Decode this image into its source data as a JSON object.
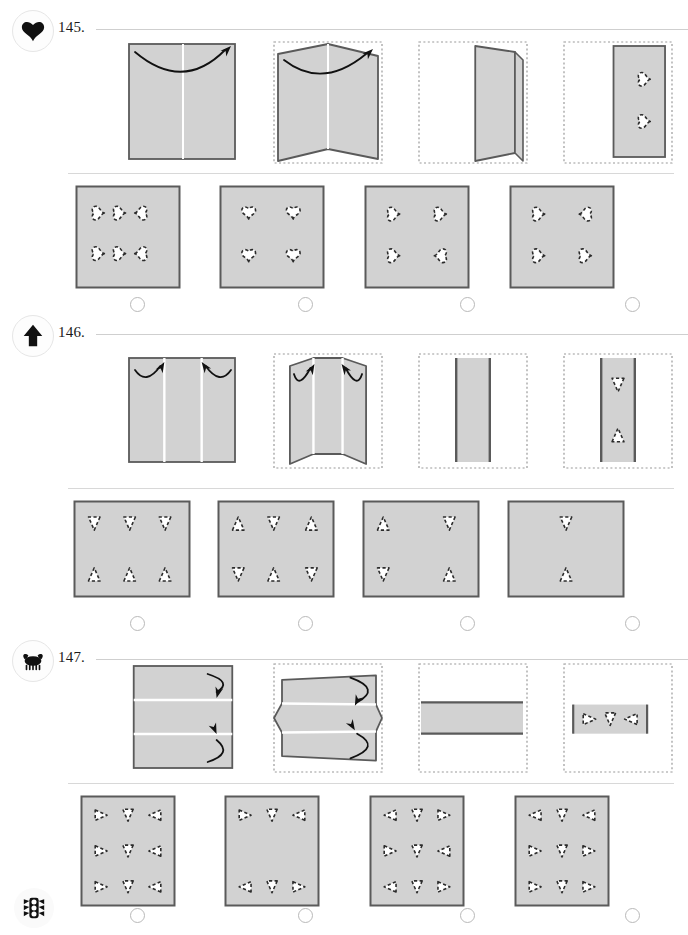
{
  "page": {
    "width": 688,
    "height": 935,
    "paper_fill": "#d2d2d2",
    "paper_stroke": "#5a5a5a",
    "ghost_stroke": "#9a9a9a",
    "cut_stroke": "#2b2b2b",
    "cut_fill": "#ffffff",
    "rule_color": "#cfcfcf",
    "arrow_color": "#111111"
  },
  "footer": {
    "icon": "traffic-light-icon"
  },
  "questions": [
    {
      "number": "145.",
      "icon": "heart-icon",
      "top": 10,
      "prompt_top": 40,
      "options_top": 185,
      "radios_top": 297,
      "shape": "heart",
      "prompt": [
        {
          "name": "fold-step-1",
          "type": "flat-square",
          "creases": [
            "v-center"
          ],
          "arrow": "curve-up-right"
        },
        {
          "name": "fold-step-2",
          "type": "bent-book",
          "ghost": true
        },
        {
          "name": "fold-step-3",
          "type": "folded-half",
          "ghost": true
        },
        {
          "name": "fold-step-4",
          "type": "punched-half",
          "ghost": true,
          "cuts": [
            {
              "x": 0.55,
              "y": 0.3,
              "rot": -90
            },
            {
              "x": 0.55,
              "y": 0.68,
              "rot": -90
            }
          ]
        }
      ],
      "options": [
        {
          "label": "option-a",
          "cuts": [
            {
              "x": 0.22,
              "y": 0.27,
              "rot": -90
            },
            {
              "x": 0.42,
              "y": 0.27,
              "rot": -90
            },
            {
              "x": 0.62,
              "y": 0.27,
              "rot": 90
            },
            {
              "x": 0.22,
              "y": 0.66,
              "rot": -90
            },
            {
              "x": 0.42,
              "y": 0.66,
              "rot": -90
            },
            {
              "x": 0.62,
              "y": 0.66,
              "rot": 90
            }
          ]
        },
        {
          "label": "option-b",
          "cuts": [
            {
              "x": 0.28,
              "y": 0.27,
              "rot": 0
            },
            {
              "x": 0.7,
              "y": 0.27,
              "rot": 0
            },
            {
              "x": 0.28,
              "y": 0.68,
              "rot": 0
            },
            {
              "x": 0.7,
              "y": 0.68,
              "rot": 0
            }
          ]
        },
        {
          "label": "option-c",
          "cuts": [
            {
              "x": 0.28,
              "y": 0.28,
              "rot": -90
            },
            {
              "x": 0.72,
              "y": 0.28,
              "rot": -90
            },
            {
              "x": 0.28,
              "y": 0.68,
              "rot": -90
            },
            {
              "x": 0.72,
              "y": 0.68,
              "rot": 90
            }
          ]
        },
        {
          "label": "option-d",
          "cuts": [
            {
              "x": 0.28,
              "y": 0.28,
              "rot": -90
            },
            {
              "x": 0.72,
              "y": 0.28,
              "rot": 90
            },
            {
              "x": 0.28,
              "y": 0.68,
              "rot": -90
            },
            {
              "x": 0.72,
              "y": 0.68,
              "rot": -90
            }
          ]
        }
      ]
    },
    {
      "number": "146.",
      "icon": "arrow-up-icon",
      "top": 315,
      "prompt_top": 352,
      "options_top": 500,
      "radios_top": 616,
      "shape": "triangle",
      "prompt": [
        {
          "name": "fold-step-1",
          "type": "flat-wide",
          "creases": [
            "v-third",
            "v-twothird"
          ],
          "arrow": "two-inward"
        },
        {
          "name": "fold-step-2",
          "type": "bent-trifold",
          "ghost": true
        },
        {
          "name": "fold-step-3",
          "type": "folded-third",
          "ghost": true
        },
        {
          "name": "fold-step-4",
          "type": "punched-third",
          "ghost": true,
          "cuts": [
            {
              "x": 0.5,
              "y": 0.26,
              "rot": 90
            },
            {
              "x": 0.5,
              "y": 0.74,
              "rot": -90
            }
          ]
        }
      ],
      "options": [
        {
          "label": "option-a",
          "cuts": [
            {
              "x": 0.18,
              "y": 0.24,
              "rot": 90
            },
            {
              "x": 0.48,
              "y": 0.24,
              "rot": 90
            },
            {
              "x": 0.78,
              "y": 0.24,
              "rot": 90
            },
            {
              "x": 0.18,
              "y": 0.76,
              "rot": -90
            },
            {
              "x": 0.48,
              "y": 0.76,
              "rot": -90
            },
            {
              "x": 0.78,
              "y": 0.76,
              "rot": -90
            }
          ]
        },
        {
          "label": "option-b",
          "cuts": [
            {
              "x": 0.18,
              "y": 0.24,
              "rot": -90
            },
            {
              "x": 0.48,
              "y": 0.24,
              "rot": 90
            },
            {
              "x": 0.8,
              "y": 0.24,
              "rot": -90
            },
            {
              "x": 0.18,
              "y": 0.76,
              "rot": 90
            },
            {
              "x": 0.48,
              "y": 0.76,
              "rot": -90
            },
            {
              "x": 0.8,
              "y": 0.76,
              "rot": 90
            }
          ]
        },
        {
          "label": "option-c",
          "cuts": [
            {
              "x": 0.18,
              "y": 0.24,
              "rot": -90
            },
            {
              "x": 0.74,
              "y": 0.24,
              "rot": 90
            },
            {
              "x": 0.18,
              "y": 0.76,
              "rot": 90
            },
            {
              "x": 0.74,
              "y": 0.76,
              "rot": -90
            }
          ]
        },
        {
          "label": "option-d",
          "cuts": [
            {
              "x": 0.5,
              "y": 0.24,
              "rot": 90
            },
            {
              "x": 0.5,
              "y": 0.76,
              "rot": -90
            }
          ]
        }
      ]
    },
    {
      "number": "147.",
      "icon": "crab-icon",
      "top": 640,
      "prompt_top": 662,
      "options_top": 795,
      "radios_top": 908,
      "shape": "triangle",
      "prompt": [
        {
          "name": "fold-step-1",
          "type": "flat-tall",
          "creases": [
            "h-third",
            "h-twothird"
          ],
          "arrow": "two-vertical"
        },
        {
          "name": "fold-step-2",
          "type": "bent-trifold-h",
          "ghost": true
        },
        {
          "name": "fold-step-3",
          "type": "folded-band",
          "ghost": true
        },
        {
          "name": "fold-step-4",
          "type": "punched-band",
          "ghost": true,
          "cuts": [
            {
              "x": 0.22,
              "y": 0.5,
              "rot": 0
            },
            {
              "x": 0.5,
              "y": 0.5,
              "rot": 90
            },
            {
              "x": 0.78,
              "y": 0.5,
              "rot": 180
            }
          ]
        }
      ],
      "options": [
        {
          "label": "option-a",
          "cuts": [
            {
              "x": 0.22,
              "y": 0.18,
              "rot": 0
            },
            {
              "x": 0.5,
              "y": 0.18,
              "rot": 90
            },
            {
              "x": 0.78,
              "y": 0.18,
              "rot": 180
            },
            {
              "x": 0.22,
              "y": 0.5,
              "rot": 0
            },
            {
              "x": 0.5,
              "y": 0.5,
              "rot": 90
            },
            {
              "x": 0.78,
              "y": 0.5,
              "rot": 180
            },
            {
              "x": 0.22,
              "y": 0.82,
              "rot": 0
            },
            {
              "x": 0.5,
              "y": 0.82,
              "rot": 90
            },
            {
              "x": 0.78,
              "y": 0.82,
              "rot": 180
            }
          ]
        },
        {
          "label": "option-b",
          "cuts": [
            {
              "x": 0.22,
              "y": 0.18,
              "rot": 0
            },
            {
              "x": 0.5,
              "y": 0.18,
              "rot": 90
            },
            {
              "x": 0.78,
              "y": 0.18,
              "rot": 180
            },
            {
              "x": 0.22,
              "y": 0.82,
              "rot": 180
            },
            {
              "x": 0.5,
              "y": 0.82,
              "rot": 90
            },
            {
              "x": 0.78,
              "y": 0.82,
              "rot": 0
            }
          ]
        },
        {
          "label": "option-c",
          "cuts": [
            {
              "x": 0.22,
              "y": 0.18,
              "rot": 180
            },
            {
              "x": 0.5,
              "y": 0.18,
              "rot": 90
            },
            {
              "x": 0.78,
              "y": 0.18,
              "rot": 0
            },
            {
              "x": 0.22,
              "y": 0.5,
              "rot": 0
            },
            {
              "x": 0.5,
              "y": 0.5,
              "rot": 90
            },
            {
              "x": 0.78,
              "y": 0.5,
              "rot": 180
            },
            {
              "x": 0.22,
              "y": 0.82,
              "rot": 180
            },
            {
              "x": 0.5,
              "y": 0.82,
              "rot": 90
            },
            {
              "x": 0.78,
              "y": 0.82,
              "rot": 0
            }
          ]
        },
        {
          "label": "option-d",
          "cuts": [
            {
              "x": 0.22,
              "y": 0.18,
              "rot": 180
            },
            {
              "x": 0.5,
              "y": 0.18,
              "rot": 90
            },
            {
              "x": 0.78,
              "y": 0.18,
              "rot": 180
            },
            {
              "x": 0.22,
              "y": 0.5,
              "rot": 0
            },
            {
              "x": 0.5,
              "y": 0.5,
              "rot": 90
            },
            {
              "x": 0.78,
              "y": 0.5,
              "rot": 0
            },
            {
              "x": 0.22,
              "y": 0.82,
              "rot": 0
            },
            {
              "x": 0.5,
              "y": 0.82,
              "rot": 90
            },
            {
              "x": 0.78,
              "y": 0.82,
              "rot": 0
            }
          ]
        }
      ]
    }
  ]
}
